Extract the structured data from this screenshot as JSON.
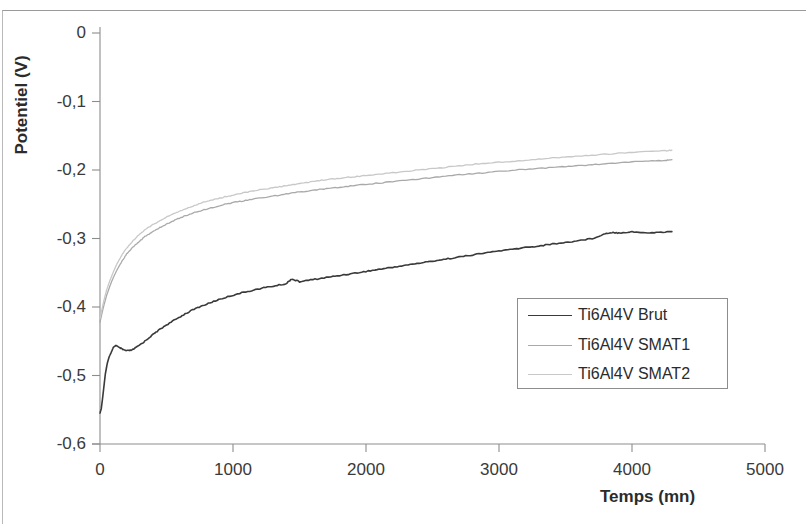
{
  "chart_data": {
    "type": "line",
    "title": "",
    "xlabel": "Temps (mn)",
    "ylabel": "Potentiel (V)",
    "xlim": [
      0,
      5000
    ],
    "ylim": [
      -0.6,
      0
    ],
    "xticks": [
      "0",
      "1000",
      "2000",
      "3000",
      "4000",
      "5000"
    ],
    "xtick_values": [
      0,
      1000,
      2000,
      3000,
      4000,
      5000
    ],
    "yticks": [
      "0",
      "-0,1",
      "-0,2",
      "-0,3",
      "-0,4",
      "-0,5",
      "-0,6"
    ],
    "ytick_values": [
      0,
      -0.1,
      -0.2,
      -0.3,
      -0.4,
      -0.5,
      -0.6
    ],
    "grid": false,
    "legend_position": "center-right",
    "decimal_separator": ",",
    "series": [
      {
        "name": "Ti6Al4V Brut",
        "color": "#3a3a3a",
        "x": [
          0,
          10,
          20,
          30,
          40,
          55,
          70,
          85,
          100,
          120,
          145,
          170,
          200,
          240,
          280,
          330,
          380,
          440,
          500,
          570,
          640,
          720,
          800,
          880,
          960,
          1050,
          1140,
          1230,
          1320,
          1400,
          1440,
          1500,
          1600,
          1700,
          1800,
          1900,
          2000,
          2100,
          2200,
          2300,
          2400,
          2500,
          2600,
          2700,
          2800,
          2900,
          3000,
          3100,
          3200,
          3300,
          3400,
          3500,
          3600,
          3700,
          3800,
          3850,
          3900,
          4000,
          4100,
          4200,
          4300
        ],
        "y": [
          -0.555,
          -0.548,
          -0.532,
          -0.515,
          -0.498,
          -0.482,
          -0.472,
          -0.466,
          -0.459,
          -0.456,
          -0.459,
          -0.462,
          -0.464,
          -0.463,
          -0.458,
          -0.451,
          -0.443,
          -0.434,
          -0.426,
          -0.418,
          -0.41,
          -0.402,
          -0.396,
          -0.39,
          -0.385,
          -0.38,
          -0.376,
          -0.372,
          -0.369,
          -0.366,
          -0.359,
          -0.363,
          -0.36,
          -0.357,
          -0.354,
          -0.351,
          -0.348,
          -0.345,
          -0.342,
          -0.339,
          -0.336,
          -0.333,
          -0.33,
          -0.327,
          -0.324,
          -0.321,
          -0.318,
          -0.316,
          -0.313,
          -0.311,
          -0.308,
          -0.306,
          -0.303,
          -0.3,
          -0.293,
          -0.291,
          -0.292,
          -0.29,
          -0.292,
          -0.291,
          -0.29
        ]
      },
      {
        "name": "Ti6Al4V SMAT1",
        "color": "#a9a9a9",
        "x": [
          0,
          15,
          30,
          50,
          75,
          100,
          130,
          165,
          200,
          245,
          290,
          340,
          395,
          450,
          510,
          575,
          640,
          710,
          780,
          860,
          940,
          1020,
          1110,
          1200,
          1300,
          1400,
          1500,
          1600,
          1700,
          1800,
          1900,
          2000,
          2150,
          2300,
          2450,
          2600,
          2750,
          2900,
          3050,
          3200,
          3350,
          3500,
          3650,
          3800,
          3950,
          4100,
          4250,
          4300
        ],
        "y": [
          -0.422,
          -0.409,
          -0.397,
          -0.383,
          -0.369,
          -0.357,
          -0.345,
          -0.333,
          -0.323,
          -0.313,
          -0.305,
          -0.297,
          -0.29,
          -0.284,
          -0.278,
          -0.272,
          -0.267,
          -0.262,
          -0.258,
          -0.254,
          -0.25,
          -0.247,
          -0.244,
          -0.241,
          -0.238,
          -0.235,
          -0.232,
          -0.23,
          -0.227,
          -0.225,
          -0.223,
          -0.221,
          -0.218,
          -0.215,
          -0.212,
          -0.209,
          -0.206,
          -0.204,
          -0.201,
          -0.199,
          -0.197,
          -0.195,
          -0.193,
          -0.191,
          -0.189,
          -0.187,
          -0.186,
          -0.185
        ]
      },
      {
        "name": "Ti6Al4V SMAT2",
        "color": "#c8c8c8",
        "x": [
          0,
          15,
          30,
          50,
          75,
          100,
          130,
          165,
          200,
          245,
          290,
          340,
          395,
          450,
          510,
          575,
          640,
          710,
          780,
          860,
          940,
          1020,
          1110,
          1200,
          1300,
          1400,
          1500,
          1600,
          1700,
          1800,
          1900,
          2000,
          2150,
          2300,
          2450,
          2600,
          2750,
          2900,
          3050,
          3200,
          3350,
          3500,
          3650,
          3800,
          3950,
          4100,
          4250,
          4300
        ],
        "y": [
          -0.417,
          -0.403,
          -0.39,
          -0.375,
          -0.361,
          -0.349,
          -0.336,
          -0.324,
          -0.314,
          -0.304,
          -0.295,
          -0.287,
          -0.28,
          -0.274,
          -0.268,
          -0.262,
          -0.257,
          -0.252,
          -0.247,
          -0.243,
          -0.239,
          -0.236,
          -0.232,
          -0.229,
          -0.226,
          -0.223,
          -0.22,
          -0.217,
          -0.214,
          -0.212,
          -0.21,
          -0.208,
          -0.205,
          -0.202,
          -0.199,
          -0.196,
          -0.193,
          -0.19,
          -0.188,
          -0.186,
          -0.183,
          -0.181,
          -0.179,
          -0.177,
          -0.175,
          -0.173,
          -0.172,
          -0.171
        ]
      }
    ]
  },
  "legend": {
    "entries": [
      {
        "label": "Ti6Al4V Brut"
      },
      {
        "label": "Ti6Al4V SMAT1"
      },
      {
        "label": "Ti6Al4V SMAT2"
      }
    ]
  },
  "axes": {
    "y_title": "Potentiel (V)",
    "x_title": "Temps (mn)"
  },
  "colors": {
    "axis": "#8d8d8d",
    "text": "#2b2b2b",
    "series_brut": "#3a3a3a",
    "series_smat1": "#a9a9a9",
    "series_smat2": "#c8c8c8"
  }
}
